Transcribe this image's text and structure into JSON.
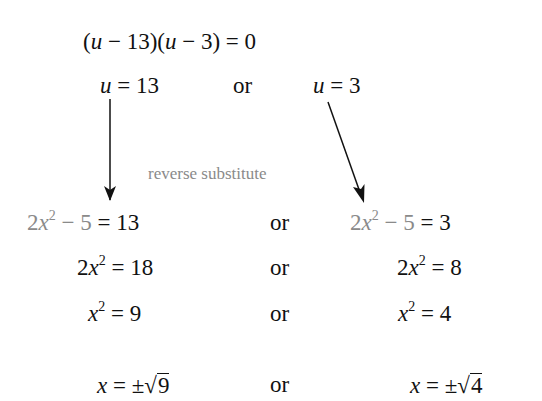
{
  "lines": {
    "factored": {
      "text": "(u − 13)(u − 3) = 0"
    },
    "roots_u": {
      "left": {
        "var": "u",
        "eq": "= 13"
      },
      "conj": "or",
      "right": {
        "var": "u",
        "eq": "= 3"
      }
    },
    "annotation": "reverse substitute",
    "step1": {
      "left": {
        "lhs": "2x² − 5",
        "rhs": "= 13"
      },
      "conj": "or",
      "right": {
        "lhs": "2x² − 5",
        "rhs": "= 3"
      }
    },
    "step2": {
      "left": "2x² = 18",
      "conj": "or",
      "right": "2x² = 8"
    },
    "step3": {
      "left": "x² = 9",
      "conj": "or",
      "right": "x² = 4"
    },
    "step4": {
      "left": {
        "prefix": "= ±",
        "radicand": "9"
      },
      "conj": "or",
      "right": {
        "prefix": "= ±",
        "radicand": "4"
      }
    }
  },
  "colors": {
    "text": "#111111",
    "substitution": "#8a8a8a",
    "arrow": "#111111"
  }
}
